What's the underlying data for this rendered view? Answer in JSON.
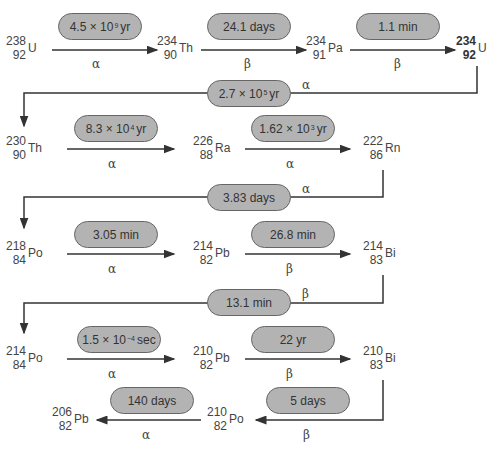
{
  "diagram": {
    "nuclides": [
      {
        "id": "U238",
        "mass": "238",
        "z": "92",
        "symbol": "U"
      },
      {
        "id": "Th234",
        "mass": "234",
        "z": "90",
        "symbol": "Th"
      },
      {
        "id": "Pa234",
        "mass": "234",
        "z": "91",
        "symbol": "Pa"
      },
      {
        "id": "U234",
        "mass": "234",
        "z": "92",
        "symbol": "U"
      },
      {
        "id": "Th230",
        "mass": "230",
        "z": "90",
        "symbol": "Th"
      },
      {
        "id": "Ra226",
        "mass": "226",
        "z": "88",
        "symbol": "Ra"
      },
      {
        "id": "Rn222",
        "mass": "222",
        "z": "86",
        "symbol": "Rn"
      },
      {
        "id": "Po218",
        "mass": "218",
        "z": "84",
        "symbol": "Po"
      },
      {
        "id": "Pb214",
        "mass": "214",
        "z": "82",
        "symbol": "Pb"
      },
      {
        "id": "Bi214",
        "mass": "214",
        "z": "83",
        "symbol": "Bi"
      },
      {
        "id": "Po214",
        "mass": "214",
        "z": "84",
        "symbol": "Po"
      },
      {
        "id": "Pb210",
        "mass": "210",
        "z": "82",
        "symbol": "Pb"
      },
      {
        "id": "Bi210",
        "mass": "210",
        "z": "83",
        "symbol": "Bi"
      },
      {
        "id": "Po210",
        "mass": "210",
        "z": "82",
        "symbol": "Po"
      },
      {
        "id": "Pb206",
        "mass": "206",
        "z": "82",
        "symbol": "Pb"
      }
    ],
    "decays": [
      {
        "from": "U238",
        "to": "Th234",
        "half_life_base": "4.5 × 10",
        "half_life_exp": "9",
        "half_life_unit": "yr",
        "mode": "α"
      },
      {
        "from": "Th234",
        "to": "Pa234",
        "half_life": "24.1 days",
        "mode": "β"
      },
      {
        "from": "Pa234",
        "to": "U234",
        "half_life": "1.1 min",
        "mode": "β"
      },
      {
        "from": "U234",
        "to": "Th230",
        "half_life_base": "2.7 × 10",
        "half_life_exp": "5",
        "half_life_unit": "yr",
        "mode": "α"
      },
      {
        "from": "Th230",
        "to": "Ra226",
        "half_life_base": "8.3 × 10",
        "half_life_exp": "4",
        "half_life_unit": "yr",
        "mode": "α"
      },
      {
        "from": "Ra226",
        "to": "Rn222",
        "half_life_base": "1.62 × 10",
        "half_life_exp": "3",
        "half_life_unit": "yr",
        "mode": "α"
      },
      {
        "from": "Rn222",
        "to": "Po218",
        "half_life": "3.83 days",
        "mode": "α"
      },
      {
        "from": "Po218",
        "to": "Pb214",
        "half_life": "3.05 min",
        "mode": "α"
      },
      {
        "from": "Pb214",
        "to": "Bi214",
        "half_life": "26.8 min",
        "mode": "β"
      },
      {
        "from": "Bi214",
        "to": "Po214",
        "half_life": "13.1 min",
        "mode": "β"
      },
      {
        "from": "Po214",
        "to": "Pb210",
        "half_life_base": "1.5 × 10",
        "half_life_exp": "−4",
        "half_life_unit": "sec",
        "mode": "α"
      },
      {
        "from": "Pb210",
        "to": "Bi210",
        "half_life": "22 yr",
        "mode": "β"
      },
      {
        "from": "Bi210",
        "to": "Po210",
        "half_life": "5 days",
        "mode": "β"
      },
      {
        "from": "Po210",
        "to": "Pb206",
        "half_life": "140 days",
        "mode": "α"
      }
    ]
  },
  "colors": {
    "pill_fill": "#b3b3b3",
    "pill_border": "#666666",
    "line": "#333333",
    "text": "#444444"
  }
}
